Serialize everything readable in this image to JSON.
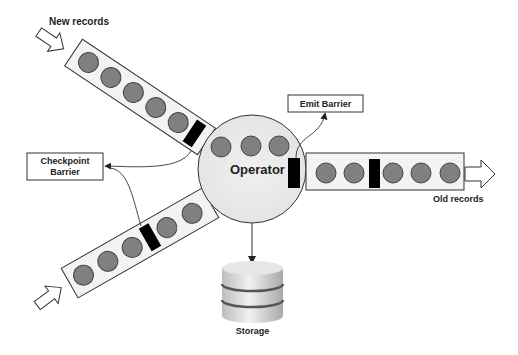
{
  "diagram": {
    "labels": {
      "new_records": "New records",
      "old_records": "Old records",
      "operator": "Operator",
      "emit_barrier": "Emit Barrier",
      "checkpoint_barrier_line1": "Checkpoint",
      "checkpoint_barrier_line2": "Barrier",
      "storage": "Storage"
    },
    "colors": {
      "record_fill": "#808080",
      "record_stroke": "#444444",
      "barrier_fill": "#000000",
      "queue_fill": "#f0f0f0",
      "operator_fill": "#ececec",
      "line": "#333333"
    },
    "nodes": [
      {
        "id": "input-queue-1",
        "kind": "queue",
        "records": 5,
        "barriers": 1
      },
      {
        "id": "input-queue-2",
        "kind": "queue",
        "records": 5,
        "barriers": 1
      },
      {
        "id": "operator",
        "kind": "operator",
        "records": 3,
        "barriers": 1
      },
      {
        "id": "output-queue",
        "kind": "queue",
        "records": 5,
        "barriers": 1
      },
      {
        "id": "storage",
        "kind": "database"
      }
    ],
    "edges": [
      {
        "from": "input-queue-1.barrier",
        "to": "checkpoint-barrier-label"
      },
      {
        "from": "input-queue-2.barrier",
        "to": "checkpoint-barrier-label"
      },
      {
        "from": "operator.barrier",
        "to": "emit-barrier-label"
      },
      {
        "from": "operator",
        "to": "storage"
      }
    ]
  }
}
